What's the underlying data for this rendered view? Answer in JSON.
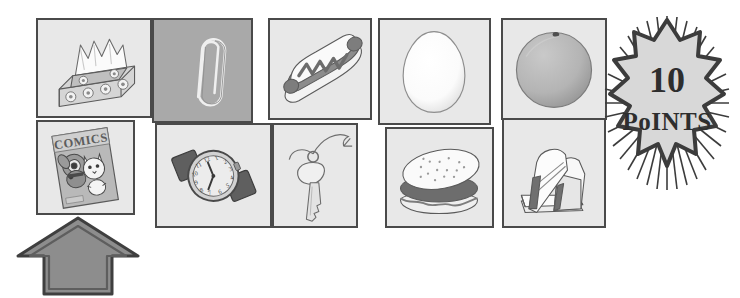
{
  "worksheet": {
    "background_color": "#ffffff",
    "panel_fill": "#e8e8e8",
    "panel_fill_dark": "#a9a9a9",
    "panel_border_color": "#4a4a4a",
    "ink_color": "#5a5a5a"
  },
  "rows": [
    {
      "name": "top-row",
      "groups": [
        {
          "name": "group-1",
          "panels": [
            {
              "name": "tissue-box",
              "label": "tissue box",
              "x": 36,
              "y": 18,
              "w": 116,
              "h": 100,
              "shade": "light"
            },
            {
              "name": "paper-clip",
              "label": "paper clip",
              "x": 152,
              "y": 18,
              "w": 101,
              "h": 105,
              "shade": "dark"
            }
          ]
        },
        {
          "name": "group-2",
          "panels": [
            {
              "name": "hot-dog",
              "label": "hot dog",
              "x": 268,
              "y": 18,
              "w": 104,
              "h": 102,
              "shade": "light"
            },
            {
              "name": "egg",
              "label": "egg",
              "x": 378,
              "y": 18,
              "w": 113,
              "h": 107,
              "shade": "light"
            }
          ]
        },
        {
          "name": "group-3",
          "panels": [
            {
              "name": "orange",
              "label": "orange",
              "x": 501,
              "y": 18,
              "w": 106,
              "h": 102,
              "shade": "light"
            }
          ]
        }
      ]
    },
    {
      "name": "bottom-row",
      "groups": [
        {
          "name": "group-4",
          "panels": [
            {
              "name": "comic-book",
              "label": "comic book",
              "x": 36,
              "y": 120,
              "w": 99,
              "h": 95,
              "shade": "light"
            }
          ]
        },
        {
          "name": "group-5",
          "panels": [
            {
              "name": "wrist-watch",
              "label": "wrist watch",
              "x": 155,
              "y": 123,
              "w": 117,
              "h": 105,
              "shade": "light"
            },
            {
              "name": "key",
              "label": "key",
              "x": 272,
              "y": 123,
              "w": 86,
              "h": 105,
              "shade": "light"
            }
          ]
        },
        {
          "name": "group-6",
          "panels": [
            {
              "name": "hamburger",
              "label": "hamburger",
              "x": 385,
              "y": 127,
              "w": 109,
              "h": 101,
              "shade": "light"
            },
            {
              "name": "sandwich",
              "label": "sandwich",
              "x": 502,
              "y": 118,
              "w": 104,
              "h": 110,
              "shade": "light"
            }
          ]
        }
      ]
    }
  ],
  "comic_book": {
    "cover_title": "COMICS",
    "cover_characters": [
      "dog",
      "cat"
    ]
  },
  "arrow": {
    "name": "up-arrow",
    "direction": "up",
    "points_to": "comic-book",
    "x": 14,
    "y": 214,
    "w": 128,
    "h": 84,
    "fill": "#8d8d8d",
    "outline": "#4a4a4a"
  },
  "badge": {
    "name": "points-badge",
    "number": "10",
    "unit": "PoINTS",
    "x": 596,
    "y": 14,
    "w": 142,
    "h": 178,
    "fill": "#d8d8d8",
    "outline": "#3c3c3c"
  },
  "watch": {
    "hour_hand": "12",
    "minute_hand": "7",
    "numerals": [
      "12",
      "1",
      "2",
      "3",
      "4",
      "5",
      "6",
      "7",
      "8",
      "9",
      "10",
      "11"
    ]
  }
}
